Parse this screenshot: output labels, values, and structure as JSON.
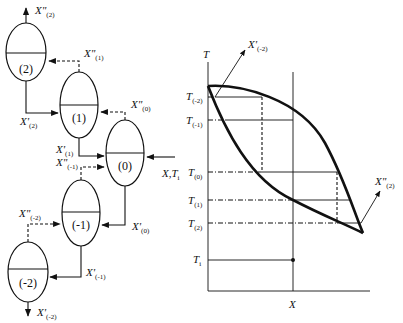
{
  "stages": [
    {
      "id": "2",
      "label": "(2)"
    },
    {
      "id": "1",
      "label": "(1)"
    },
    {
      "id": "0",
      "label": "(0)"
    },
    {
      "id": "-1",
      "label": "(-1)"
    },
    {
      "id": "-2",
      "label": "(-2)"
    }
  ],
  "streams": {
    "vapor_out_2": {
      "main": "X\"",
      "sub": "(2)"
    },
    "vapor_1": {
      "main": "X\"",
      "sub": "(1)"
    },
    "vapor_0": {
      "main": "X\"",
      "sub": "(0)"
    },
    "vapor_m1": {
      "main": "X\"",
      "sub": "(-1)"
    },
    "vapor_m2": {
      "main": "X\"",
      "sub": "(-2)"
    },
    "liquid_2": {
      "main": "X'",
      "sub": "(2)"
    },
    "liquid_1": {
      "main": "X'",
      "sub": "(1)"
    },
    "liquid_0": {
      "main": "X'",
      "sub": "(0)"
    },
    "liquid_m1": {
      "main": "X'",
      "sub": "(-1)"
    },
    "liquid_out_m2": {
      "main": "X'",
      "sub": "(-2)"
    },
    "feed": {
      "main": "X,T",
      "sub": "i"
    }
  },
  "phase_diagram": {
    "y_axis_label": "T",
    "x_axis_label": "X",
    "temperature_ticks": [
      {
        "main": "T",
        "sub": "(-2)"
      },
      {
        "main": "T",
        "sub": "(-1)"
      },
      {
        "main": "T",
        "sub": "(0)"
      },
      {
        "main": "T",
        "sub": "(1)"
      },
      {
        "main": "T",
        "sub": "(2)"
      },
      {
        "main": "T",
        "sub": "i"
      }
    ],
    "arrow_top": {
      "main": "X'",
      "sub": "(-2)"
    },
    "arrow_bottom": {
      "main": "X\"",
      "sub": "(2)"
    }
  }
}
